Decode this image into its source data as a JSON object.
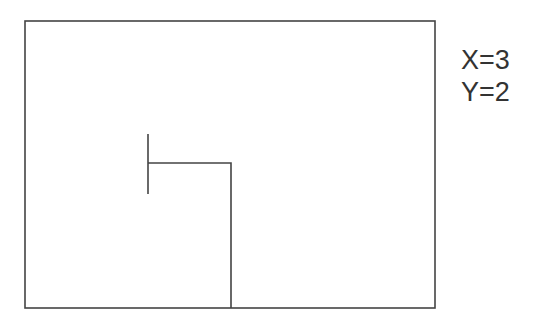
{
  "diagram": {
    "frame": {
      "x": 25,
      "y": 21,
      "width": 410,
      "height": 287,
      "stroke": "#444444"
    },
    "path": {
      "stroke": "#444444",
      "tick": {
        "x": 148,
        "y1": 134,
        "y2": 194
      },
      "points": [
        [
          148,
          163
        ],
        [
          231,
          163
        ],
        [
          231,
          308
        ]
      ]
    }
  },
  "coords": {
    "x_label": "X=3",
    "y_label": "Y=2"
  }
}
